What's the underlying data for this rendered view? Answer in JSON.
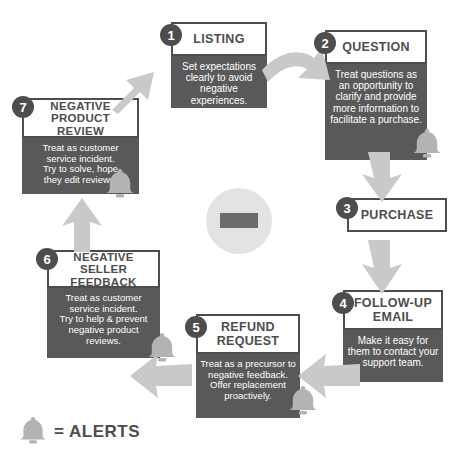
{
  "diagram": {
    "colors": {
      "box_border": "#4d4d4d",
      "box_body_bg": "#595959",
      "badge_bg": "#4d4d4d",
      "arrow": "#c9c9c9",
      "center_circle": "#e3e3e3",
      "center_minus": "#6b6b6b",
      "bell": "#b3b3b3",
      "text_dark": "#4d4d4d",
      "text_light": "#ffffff"
    },
    "center": {
      "symbol": "−",
      "icon_name": "minus-sign"
    },
    "steps": [
      {
        "number": "1",
        "title": "LISTING",
        "body": "Set expectations\nclearly to avoid\nnegative experiences.",
        "has_alert": false
      },
      {
        "number": "2",
        "title": "QUESTION",
        "body": "Treat questions as\nan opportunity to\nclarify and provide\nmore information to\nfacilitate a purchase.",
        "has_alert": true
      },
      {
        "number": "3",
        "title": "PURCHASE",
        "body": "",
        "has_alert": false
      },
      {
        "number": "4",
        "title": "FOLLOW-UP\nEMAIL",
        "body": "Make it easy for\nthem to contact your\nsupport team.",
        "has_alert": false
      },
      {
        "number": "5",
        "title": "REFUND\nREQUEST",
        "body": "Treat as a precursor to\nnegative feedback.\nOffer replacement\nproactively.",
        "has_alert": true
      },
      {
        "number": "6",
        "title": "NEGATIVE SELLER\nFEEDBACK",
        "body": "Treat as customer\nservice incident.\nTry to help & prevent\nnegative product\nreviews.",
        "has_alert": true
      },
      {
        "number": "7",
        "title": "NEGATIVE\nPRODUCT REVIEW",
        "body": "Treat as customer\nservice incident.\nTry to solve, hope\nthey edit reviews.",
        "has_alert": true
      }
    ],
    "legend": {
      "icon_name": "bell-icon",
      "equals": "=",
      "label": "ALERTS",
      "text": "= ALERTS"
    }
  }
}
